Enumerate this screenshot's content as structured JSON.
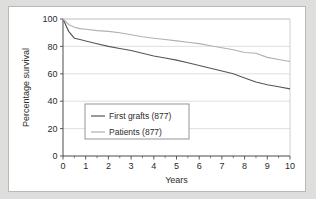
{
  "figure": {
    "frame_border_color": "#b9b9b7",
    "background_color": "#dededc",
    "plot_background": "#ffffff"
  },
  "chart_data": {
    "type": "line",
    "title": "",
    "xlabel": "Years",
    "ylabel": "Percentage survival",
    "xlim": [
      0,
      10
    ],
    "ylim": [
      0,
      100
    ],
    "xticks": [
      0,
      1,
      2,
      3,
      4,
      5,
      6,
      7,
      8,
      9,
      10
    ],
    "xtick_labels": [
      "0",
      "1",
      "2",
      "3",
      "4",
      "5",
      "6",
      "7",
      "8",
      "9",
      "10"
    ],
    "xminor_ticks": [
      0.5,
      1.5,
      2.5,
      3.5,
      4.5,
      5.5,
      6.5,
      7.5,
      8.5,
      9.5
    ],
    "yticks": [
      0,
      20,
      40,
      60,
      80,
      100
    ],
    "ytick_labels": [
      "0",
      "20",
      "40",
      "60",
      "80",
      "100"
    ],
    "grid": "horizontal",
    "legend_position": "lower-left-inside",
    "series": [
      {
        "name": "First grafts (877)",
        "color": "#555555",
        "x": [
          0,
          0.25,
          0.5,
          0.75,
          1,
          1.5,
          2,
          2.5,
          3,
          3.5,
          4,
          4.5,
          5,
          5.5,
          6,
          6.5,
          7,
          7.5,
          8,
          8.5,
          9,
          9.5,
          10
        ],
        "values": [
          100,
          91,
          86,
          85,
          84,
          82,
          80,
          78.5,
          77,
          75,
          73,
          71.5,
          70,
          68,
          66,
          64,
          62,
          60,
          57,
          54,
          52,
          50.5,
          49
        ]
      },
      {
        "name": "Patients (877)",
        "color": "#b0b0b0",
        "x": [
          0,
          0.25,
          0.5,
          0.75,
          1,
          1.5,
          2,
          2.5,
          3,
          3.5,
          4,
          4.5,
          5,
          5.5,
          6,
          6.5,
          7,
          7.5,
          8,
          8.5,
          9,
          9.5,
          10
        ],
        "values": [
          100,
          96,
          94,
          93,
          92.5,
          91.5,
          91,
          90,
          88.5,
          87,
          86,
          85,
          84,
          83,
          82,
          80.5,
          79,
          77.5,
          75.5,
          75,
          72,
          70.5,
          69
        ]
      }
    ]
  },
  "legend": {
    "entries": [
      {
        "label": "First grafts (877)",
        "color": "#555555"
      },
      {
        "label": "Patients (877)",
        "color": "#b0b0b0"
      }
    ]
  }
}
